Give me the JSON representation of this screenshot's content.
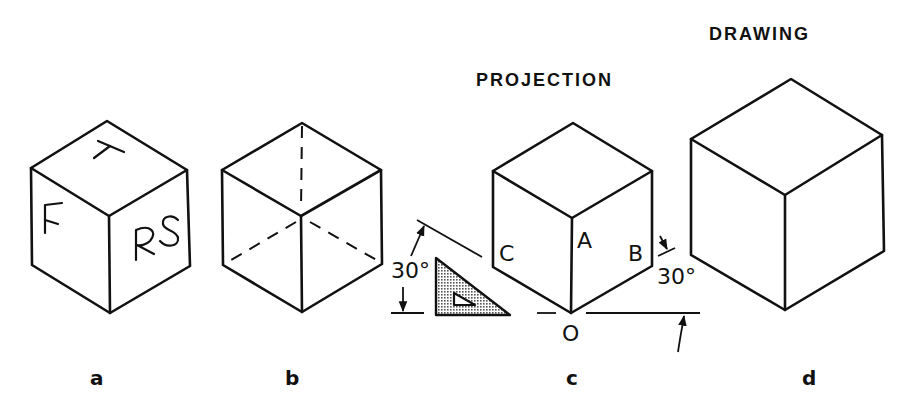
{
  "titles": {
    "projection": "PROJECTION",
    "drawing": "DRAWING"
  },
  "figures": [
    {
      "id": "a",
      "label": "a",
      "face_labels": {
        "top": "T",
        "front": "F",
        "right_side": "RS"
      }
    },
    {
      "id": "b",
      "label": "b",
      "hidden_edges": "dashed"
    },
    {
      "id": "c",
      "label": "c",
      "vertex_labels": {
        "A": "A",
        "B": "B",
        "C": "C",
        "O": "O"
      },
      "angle_left": "30°",
      "angle_right": "30°",
      "tool": "30-60 triangle (shaded)"
    },
    {
      "id": "d",
      "label": "d"
    }
  ],
  "annotations": {
    "angle_left": "30°",
    "angle_right": "30°",
    "vertex_A": "A",
    "vertex_B": "B",
    "vertex_C": "C",
    "vertex_O": "O",
    "face_T": "T",
    "face_F": "F",
    "face_RS": "RS"
  },
  "colors": {
    "ink": "#111111",
    "background": "#ffffff",
    "triangle_fill": "#b8b8b8"
  }
}
